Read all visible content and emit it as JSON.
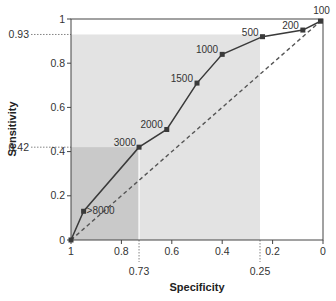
{
  "chart_data": {
    "type": "line",
    "title": "",
    "xlabel": "Specificity",
    "ylabel": "Sensitivity",
    "xlim": [
      1,
      0
    ],
    "ylim": [
      0,
      1
    ],
    "x_reversed": true,
    "grid": false,
    "legend": null,
    "xticks": [
      1,
      0.8,
      0.6,
      0.4,
      0.2,
      0
    ],
    "xtick_labels": [
      "1",
      "0.8",
      "0.6",
      "0.4",
      "0.2",
      "0"
    ],
    "yticks": [
      0,
      0.2,
      0.4,
      0.6,
      0.8,
      1
    ],
    "ytick_labels": [
      "0",
      "0.2",
      "0.4",
      "0.6",
      "0.8",
      "1"
    ],
    "series": [
      {
        "name": "ROC curve",
        "style": "solid line with square markers",
        "points": [
          {
            "label": "",
            "specificity": 1.0,
            "sensitivity": 0.0
          },
          {
            "label": ">8000",
            "specificity": 0.95,
            "sensitivity": 0.13
          },
          {
            "label": "3000",
            "specificity": 0.73,
            "sensitivity": 0.42
          },
          {
            "label": "2000",
            "specificity": 0.62,
            "sensitivity": 0.5
          },
          {
            "label": "1500",
            "specificity": 0.5,
            "sensitivity": 0.71
          },
          {
            "label": "1000",
            "specificity": 0.4,
            "sensitivity": 0.84
          },
          {
            "label": "500",
            "specificity": 0.24,
            "sensitivity": 0.92
          },
          {
            "label": "200",
            "specificity": 0.08,
            "sensitivity": 0.95
          },
          {
            "label": "100",
            "specificity": 0.01,
            "sensitivity": 0.99
          }
        ]
      },
      {
        "name": "Chance line",
        "style": "dashed diagonal",
        "points": [
          {
            "specificity": 1.0,
            "sensitivity": 0.0
          },
          {
            "specificity": 0.0,
            "sensitivity": 1.0
          }
        ]
      }
    ],
    "annotations": [
      {
        "type": "reference",
        "axis": "y",
        "value": 0.93,
        "label": "0.93"
      },
      {
        "type": "reference",
        "axis": "y",
        "value": 0.42,
        "label": "0.42"
      },
      {
        "type": "reference",
        "axis": "x",
        "value": 0.73,
        "label": "0.73"
      },
      {
        "type": "reference",
        "axis": "x",
        "value": 0.25,
        "label": "0.25"
      },
      {
        "type": "shaded_region",
        "specificity_range": [
          1,
          0.25
        ],
        "sensitivity_range": [
          0,
          0.93
        ],
        "color": "#e3e3e3"
      },
      {
        "type": "shaded_region",
        "specificity_range": [
          1,
          0.73
        ],
        "sensitivity_range": [
          0,
          0.42
        ],
        "color": "#c9c9c9"
      }
    ]
  },
  "colors": {
    "line": "#3a3a3a",
    "marker": "#3a3a3a",
    "dashed": "#555555",
    "shade_light": "#e3e3e3",
    "shade_dark": "#c9c9c9",
    "axis": "#444444"
  }
}
